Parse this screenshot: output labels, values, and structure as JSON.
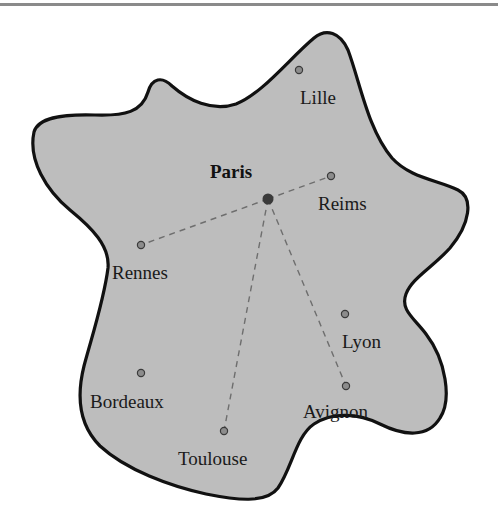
{
  "colors": {
    "land_fill": "#bdbdbd",
    "border": "#111111",
    "route": "#6e6e6e",
    "city_dot": "#8c8c8c",
    "city_dot_stroke": "#3a3a3a",
    "capital_dot": "#3a3a3a",
    "top_rule": "#8a8a8a"
  },
  "capital": {
    "name": "Paris",
    "x": 268,
    "y": 199,
    "label_x": 210,
    "label_y": 178
  },
  "cities": [
    {
      "name": "Lille",
      "x": 299,
      "y": 70,
      "label_x": 300,
      "label_y": 104
    },
    {
      "name": "Reims",
      "x": 331,
      "y": 176,
      "label_x": 318,
      "label_y": 210
    },
    {
      "name": "Rennes",
      "x": 141,
      "y": 245,
      "label_x": 112,
      "label_y": 279
    },
    {
      "name": "Lyon",
      "x": 345,
      "y": 314,
      "label_x": 342,
      "label_y": 348
    },
    {
      "name": "Bordeaux",
      "x": 141,
      "y": 373,
      "label_x": 90,
      "label_y": 408
    },
    {
      "name": "Avignon",
      "x": 346,
      "y": 386,
      "label_x": 303,
      "label_y": 418
    },
    {
      "name": "Toulouse",
      "x": 224,
      "y": 431,
      "label_x": 178,
      "label_y": 465
    }
  ],
  "routes": [
    {
      "from": "Paris",
      "to": "Reims"
    },
    {
      "from": "Paris",
      "to": "Rennes"
    },
    {
      "from": "Paris",
      "to": "Toulouse"
    },
    {
      "from": "Paris",
      "to": "Avignon"
    }
  ]
}
